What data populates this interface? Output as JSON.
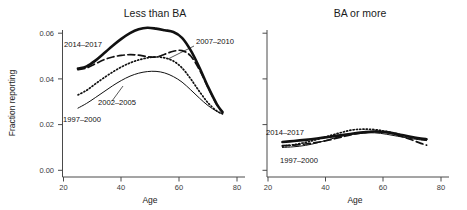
{
  "figure": {
    "axis_color": "#4a4a4a",
    "curve_color": "#111111",
    "background": "#ffffff"
  },
  "panels": {
    "left": {
      "title": "Less than BA",
      "ylabel": "Fraction reporting",
      "xlabel": "Age"
    },
    "right": {
      "title": "BA or more",
      "xlabel": "Age"
    }
  },
  "axis": {
    "y_ticks": [
      "0.00",
      "0.02",
      "0.04",
      "0.06"
    ],
    "x_ticks": [
      "20",
      "40",
      "60",
      "80"
    ]
  },
  "series_labels": {
    "left": {
      "a": "2014–2017",
      "b": "2007–2010",
      "c": "2002–2005",
      "d": "1997–2000"
    },
    "right": {
      "a": "2014–2017",
      "d": "1997–2000"
    }
  },
  "chart_data": {
    "type": "line",
    "xlabel": "Age",
    "ylabel": "Fraction reporting",
    "xlim": [
      18,
      82
    ],
    "ylim": [
      0.0,
      0.066
    ],
    "x_ticks": [
      20,
      40,
      60,
      80
    ],
    "y_ticks": [
      0.0,
      0.02,
      0.04,
      0.06
    ],
    "grid": false,
    "legend": "inline-annotations",
    "panels": [
      {
        "name": "Less than BA",
        "series": [
          {
            "name": "2014–2017",
            "style": "solid-thick",
            "x": [
              25,
              28,
              31,
              34,
              37,
              40,
              43,
              46,
              49,
              52,
              55,
              58,
              61,
              64,
              67,
              70,
              73,
              75
            ],
            "y": [
              0.0445,
              0.0455,
              0.048,
              0.0512,
              0.0545,
              0.0575,
              0.06,
              0.0617,
              0.0624,
              0.062,
              0.0613,
              0.0605,
              0.058,
              0.0525,
              0.045,
              0.0365,
              0.029,
              0.0255
            ]
          },
          {
            "name": "2007–2010",
            "style": "dashed",
            "x": [
              25,
              28,
              31,
              34,
              37,
              40,
              43,
              46,
              49,
              52,
              55,
              58,
              61,
              64,
              67,
              70,
              73,
              75
            ],
            "y": [
              0.044,
              0.0448,
              0.0466,
              0.0484,
              0.0496,
              0.0503,
              0.0506,
              0.0504,
              0.0497,
              0.0496,
              0.0508,
              0.0521,
              0.0524,
              0.05,
              0.044,
              0.0362,
              0.0288,
              0.0252
            ]
          },
          {
            "name": "2002–2005",
            "style": "dotted",
            "x": [
              25,
              28,
              31,
              34,
              37,
              40,
              43,
              46,
              49,
              52,
              55,
              58,
              61,
              64,
              67,
              70,
              73,
              75
            ],
            "y": [
              0.033,
              0.035,
              0.0378,
              0.0405,
              0.043,
              0.0452,
              0.047,
              0.0483,
              0.0492,
              0.0496,
              0.0492,
              0.0478,
              0.0448,
              0.04,
              0.0345,
              0.0295,
              0.026,
              0.0248
            ]
          },
          {
            "name": "1997–2000",
            "style": "solid-thin",
            "x": [
              25,
              28,
              31,
              34,
              37,
              40,
              43,
              46,
              49,
              52,
              55,
              58,
              61,
              64,
              67,
              70,
              73,
              75
            ],
            "y": [
              0.0272,
              0.0293,
              0.0318,
              0.0344,
              0.037,
              0.0393,
              0.0412,
              0.0425,
              0.0432,
              0.0433,
              0.0426,
              0.041,
              0.0386,
              0.0352,
              0.0316,
              0.0283,
              0.0258,
              0.0246
            ]
          }
        ]
      },
      {
        "name": "BA or more",
        "series": [
          {
            "name": "2014–2017",
            "style": "solid-thick",
            "x": [
              25,
              29,
              33,
              37,
              41,
              45,
              49,
              53,
              57,
              61,
              65,
              69,
              73,
              75
            ],
            "y": [
              0.0124,
              0.0128,
              0.0133,
              0.0139,
              0.0146,
              0.0153,
              0.016,
              0.0166,
              0.017,
              0.0167,
              0.0158,
              0.0148,
              0.0139,
              0.0136
            ]
          },
          {
            "name": "2007–2010",
            "style": "dashed",
            "x": [
              25,
              29,
              33,
              37,
              41,
              45,
              49,
              53,
              57,
              61,
              65,
              69,
              73,
              75
            ],
            "y": [
              0.0108,
              0.011,
              0.0115,
              0.0122,
              0.0132,
              0.0144,
              0.0156,
              0.0165,
              0.017,
              0.0166,
              0.0154,
              0.0137,
              0.0118,
              0.011
            ]
          },
          {
            "name": "2002–2005",
            "style": "dotted",
            "x": [
              25,
              29,
              33,
              37,
              41,
              45,
              49,
              53,
              57,
              61,
              65,
              69,
              73,
              75
            ],
            "y": [
              0.0106,
              0.0112,
              0.0122,
              0.0135,
              0.015,
              0.0164,
              0.0176,
              0.018,
              0.0178,
              0.017,
              0.0158,
              0.0146,
              0.0136,
              0.0132
            ]
          },
          {
            "name": "1997–2000",
            "style": "solid-thin",
            "x": [
              25,
              29,
              33,
              37,
              41,
              45,
              49,
              53,
              57,
              61,
              65,
              69,
              73,
              75
            ],
            "y": [
              0.01,
              0.0103,
              0.0109,
              0.012,
              0.0134,
              0.0148,
              0.0158,
              0.0163,
              0.0164,
              0.0158,
              0.0149,
              0.014,
              0.0133,
              0.013
            ]
          }
        ]
      }
    ]
  }
}
